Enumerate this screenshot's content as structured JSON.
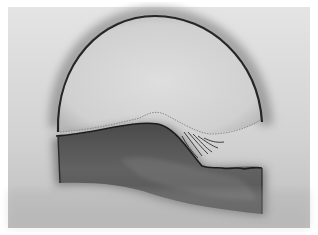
{
  "image": {
    "description": "Grayscale photograph of a dome-shaped arc over a dark wavy block with a feathered crest",
    "colors": {
      "background": "#ffffff",
      "field_light": "#dcdcdc",
      "field_mid": "#b8b8b8",
      "outline_dark": "#2a2a2a",
      "block_fill": "#5a5a5a",
      "block_dark": "#3c3c3c"
    }
  }
}
